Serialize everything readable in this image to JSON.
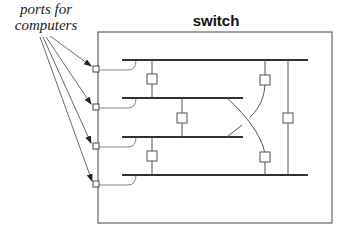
{
  "labels": {
    "ports_line1": "ports for",
    "ports_line2": "computers",
    "switch": "switch"
  },
  "diagram": {
    "type": "network-switch-internal-buses",
    "port_count": 4,
    "bus_count": 4,
    "colors": {
      "stroke": "#555555",
      "bus": "#333333",
      "background": "#ffffff"
    }
  }
}
